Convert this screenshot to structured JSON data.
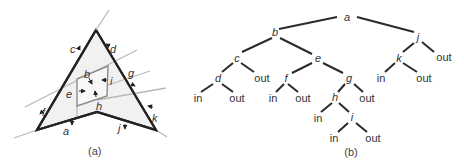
{
  "panel_a": {
    "caption": "(a)",
    "labels": {
      "a": "a",
      "b": "b",
      "c": "c",
      "d": "d",
      "e": "e",
      "f": "f",
      "g": "g",
      "h": "h",
      "i": "i",
      "j": "j",
      "k": "k"
    }
  },
  "panel_b": {
    "caption": "(b)",
    "nodes": {
      "a": "a",
      "b": "b",
      "c": "c",
      "d": "d",
      "e": "e",
      "f": "f",
      "g": "g",
      "h": "h",
      "i": "i",
      "j": "j",
      "k": "k"
    },
    "leaf_in": "in",
    "leaf_out": "out"
  },
  "colors": {
    "polygon_stroke": "#222222",
    "polygon_fill": "#f1f1f1",
    "plane_lines": "#b8b8b8",
    "tree_edges": "#2a2a2a",
    "text": "#333333"
  }
}
